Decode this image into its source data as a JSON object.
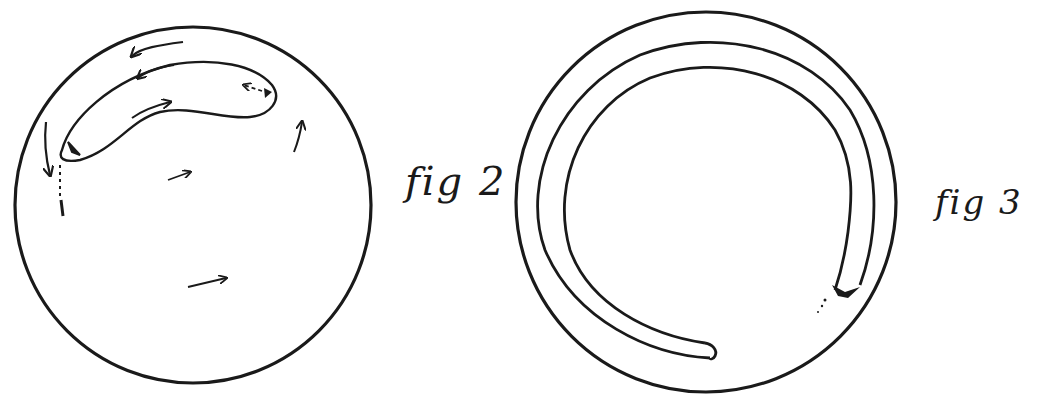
{
  "figures": [
    {
      "id": "fig2",
      "label": "fig 2",
      "description": "Circle with crescent/banana-shaped inclusion near top and flow arrows"
    },
    {
      "id": "fig3",
      "label": "fig 3",
      "description": "Circle with an inner ring-shaped spiral band ending near bottom"
    }
  ],
  "colors": {
    "ink": "#1a1a1a",
    "paper": "#ffffff"
  }
}
